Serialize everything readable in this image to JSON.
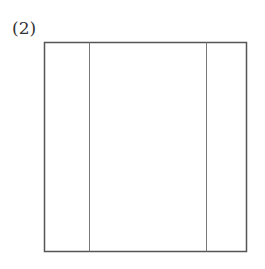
{
  "label": "(2)",
  "diagram": {
    "outer_rect": {
      "x": 44,
      "y": 42,
      "width": 202,
      "height": 209
    },
    "vertical_lines_x": [
      89,
      206
    ],
    "stroke_color": "#555555"
  }
}
